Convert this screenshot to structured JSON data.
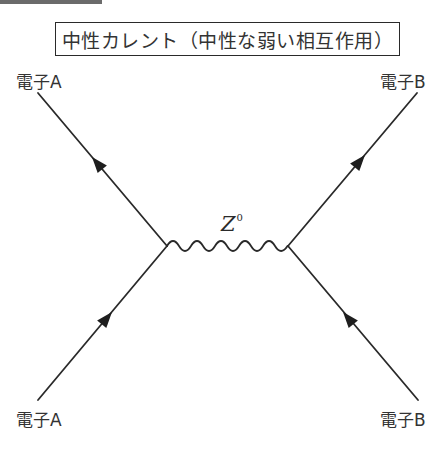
{
  "title": "中性カレント（中性な弱い相互作用）",
  "particles": {
    "top_left": "電子A",
    "top_right": "電子B",
    "bottom_left": "電子A",
    "bottom_right": "電子B"
  },
  "boson": {
    "symbol": "Z",
    "superscript": "0"
  },
  "colors": {
    "line": "#2a2a2a",
    "background": "#ffffff",
    "top_bar": "#6b6b6b"
  }
}
